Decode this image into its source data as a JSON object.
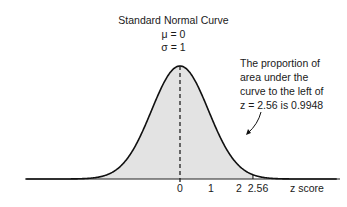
{
  "chart_data": {
    "type": "area",
    "title": "Standard Normal Curve",
    "subtitle": [
      "μ = 0",
      "σ = 1"
    ],
    "xlabel": "z score",
    "ylabel": "",
    "tick_labels": [
      "0",
      "1",
      "2",
      "2.56"
    ],
    "x_ticks": [
      0,
      1,
      2,
      2.56
    ],
    "distribution": {
      "mean": 0,
      "sd": 1
    },
    "shaded_region": {
      "from": "-inf",
      "to": 2.56,
      "area": 0.9948
    },
    "mean_line": {
      "x": 0,
      "style": "dashed"
    },
    "annotation": "The proportion of area under the curve to the left of z = 2.56 is 0.9948",
    "grid": false,
    "legend": null
  },
  "text": {
    "title": "Standard Normal Curve",
    "mu": "μ = 0",
    "sigma": "σ = 1",
    "annotation_lines": [
      "The proportion of",
      "area under the",
      "curve to the left of",
      "z = 2.56 is 0.9948"
    ],
    "ticks": [
      "0",
      "1",
      "2",
      "2.56"
    ],
    "xlabel": "z score"
  },
  "colors": {
    "curve": "#111111",
    "fill": "#e3e3e3",
    "axis": "#222222"
  }
}
